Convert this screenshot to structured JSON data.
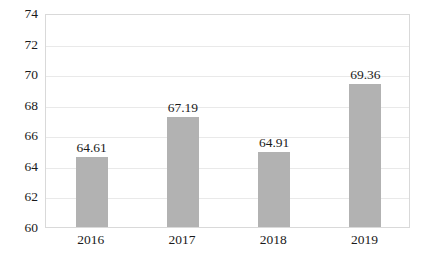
{
  "chart_data": {
    "type": "bar",
    "title": "",
    "subtitle": "",
    "xlabel": "",
    "ylabel": "",
    "categories": [
      "2016",
      "2017",
      "2018",
      "2019"
    ],
    "values": [
      64.61,
      67.19,
      64.91,
      69.36
    ],
    "data_labels": [
      "64.61",
      "67.19",
      "64.91",
      "69.36"
    ],
    "ylim": [
      60,
      74
    ],
    "ytick_step": 2,
    "ytick_labels": [
      "74",
      "72",
      "70",
      "68",
      "66",
      "64",
      "62",
      "60"
    ],
    "ytick_values": [
      74,
      72,
      70,
      68,
      66,
      64,
      62,
      60
    ],
    "grid": true,
    "grid_axis": "y",
    "legend": false,
    "legend_position": "none",
    "bar_color": "#b2b2b2",
    "gridline_color": "#e9e9e9",
    "axis_border_color": "#d9d9d9",
    "text_color": "#1a1a1a",
    "background_color": "#ffffff"
  }
}
